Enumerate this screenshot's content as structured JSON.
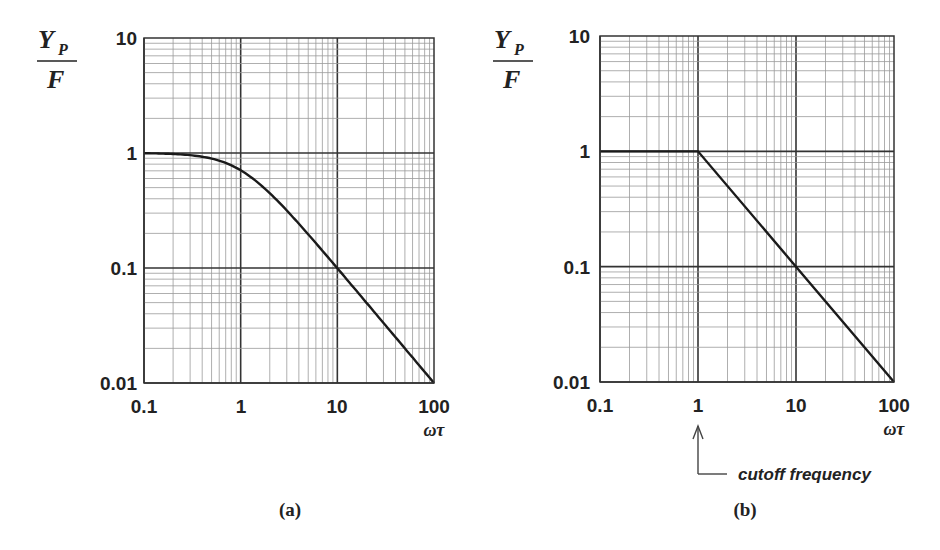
{
  "chart_data": [
    {
      "panel_label": "(a)",
      "type": "line",
      "title": "",
      "xlabel": "ωτ",
      "ylabel": {
        "numerator": "Y",
        "subscript": "P",
        "denominator": "F"
      },
      "xscale": "log",
      "yscale": "log",
      "xlim": [
        0.1,
        100
      ],
      "ylim": [
        0.01,
        10
      ],
      "x_ticks": [
        "0.1",
        "1",
        "10",
        "100"
      ],
      "y_ticks": [
        "10",
        "1",
        "0.1",
        "0.01"
      ],
      "grid": true,
      "series": [
        {
          "name": "exact response",
          "x": [
            0.1,
            0.2,
            0.3,
            0.5,
            0.7,
            1,
            1.5,
            2,
            3,
            5,
            7,
            10,
            20,
            50,
            100
          ],
          "y": [
            0.995,
            0.981,
            0.958,
            0.894,
            0.819,
            0.707,
            0.555,
            0.447,
            0.316,
            0.196,
            0.141,
            0.0995,
            0.0499,
            0.02,
            0.01
          ]
        }
      ]
    },
    {
      "panel_label": "(b)",
      "type": "line",
      "title": "",
      "xlabel": "ωτ",
      "ylabel": {
        "numerator": "Y",
        "subscript": "P",
        "denominator": "F"
      },
      "xscale": "log",
      "yscale": "log",
      "xlim": [
        0.1,
        100
      ],
      "ylim": [
        0.01,
        10
      ],
      "x_ticks": [
        "0.1",
        "1",
        "10",
        "100"
      ],
      "y_ticks": [
        "10",
        "1",
        "0.1",
        "0.01"
      ],
      "grid": true,
      "series": [
        {
          "name": "asymptotic approximation",
          "x": [
            0.1,
            1,
            10,
            100
          ],
          "y": [
            1,
            1,
            0.1,
            0.01
          ]
        }
      ],
      "annotations": [
        {
          "text": "cutoff frequency",
          "x": 1,
          "arrow": true
        }
      ]
    }
  ],
  "labels": {
    "y_num": "Y",
    "y_sub": "P",
    "y_den": "F",
    "x_axis": "ωτ",
    "ticks_x": [
      "0.1",
      "1",
      "10",
      "100"
    ],
    "ticks_y": [
      "10",
      "1",
      "0.1",
      "0.01"
    ],
    "panel_a": "(a)",
    "panel_b": "(b)",
    "cutoff": "cutoff frequency"
  }
}
